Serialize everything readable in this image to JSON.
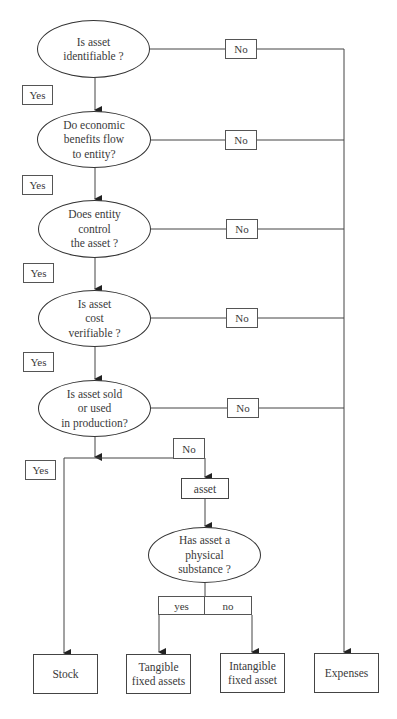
{
  "diagram": {
    "type": "flowchart",
    "decisions": [
      {
        "id": "d1",
        "text_lines": [
          "Is asset",
          "identifiable ?"
        ]
      },
      {
        "id": "d2",
        "text_lines": [
          "Do economic",
          "benefits flow",
          "to entity?"
        ]
      },
      {
        "id": "d3",
        "text_lines": [
          "Does entity",
          "control",
          "the asset ?"
        ]
      },
      {
        "id": "d4",
        "text_lines": [
          "Is asset",
          "cost",
          "verifiable ?"
        ]
      },
      {
        "id": "d5",
        "text_lines": [
          "Is asset sold",
          "or used",
          "in production?"
        ]
      },
      {
        "id": "d6",
        "text_lines": [
          "Has asset a",
          "physical",
          "substance ?"
        ]
      }
    ],
    "labels": {
      "yes": "Yes",
      "no": "No",
      "yes_lower": "yes",
      "no_lower": "no"
    },
    "intermediate": {
      "asset": "asset"
    },
    "outcomes": [
      {
        "id": "stock",
        "text_lines": [
          "Stock"
        ]
      },
      {
        "id": "tangible",
        "text_lines": [
          "Tangible",
          "fixed assets"
        ]
      },
      {
        "id": "intangible",
        "text_lines": [
          "Intangible",
          "fixed asset"
        ]
      },
      {
        "id": "expenses",
        "text_lines": [
          "Expenses"
        ]
      }
    ],
    "edges": [
      {
        "from": "d1",
        "to": "d2",
        "label": "Yes"
      },
      {
        "from": "d1",
        "to": "expenses",
        "label": "No"
      },
      {
        "from": "d2",
        "to": "d3",
        "label": "Yes"
      },
      {
        "from": "d2",
        "to": "expenses",
        "label": "No"
      },
      {
        "from": "d3",
        "to": "d4",
        "label": "Yes"
      },
      {
        "from": "d3",
        "to": "expenses",
        "label": "No"
      },
      {
        "from": "d4",
        "to": "d5",
        "label": "Yes"
      },
      {
        "from": "d4",
        "to": "expenses",
        "label": "No"
      },
      {
        "from": "d5",
        "to": "expenses",
        "label": "No"
      },
      {
        "from": "d5",
        "to": "stock",
        "label": "Yes"
      },
      {
        "from": "d5",
        "to": "asset",
        "label": "No"
      },
      {
        "from": "asset",
        "to": "d6",
        "label": ""
      },
      {
        "from": "d6",
        "to": "tangible",
        "label": "yes"
      },
      {
        "from": "d6",
        "to": "intangible",
        "label": "no"
      }
    ]
  }
}
